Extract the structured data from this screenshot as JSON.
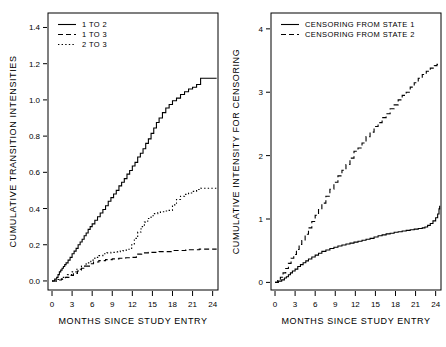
{
  "figure": {
    "width": 446,
    "height": 347,
    "background": "#ffffff",
    "ink_color": "#000000"
  },
  "chart_data": [
    {
      "id": "left",
      "type": "line",
      "title": "",
      "xlabel": "MONTHS SINCE STUDY ENTRY",
      "ylabel": "CUMULATIVE TRANSITION INTENSITIES",
      "xlim": [
        -0.6,
        24.8
      ],
      "ylim": [
        -0.05,
        1.48
      ],
      "xticks": [
        0,
        3,
        6,
        9,
        12,
        15,
        18,
        21,
        24
      ],
      "xtick_labels": [
        "0",
        "3",
        "6",
        "9",
        "12",
        "15",
        "18",
        "21",
        "24"
      ],
      "yticks": [
        0.0,
        0.2,
        0.4,
        0.6,
        0.8,
        1.0,
        1.2,
        1.4
      ],
      "ytick_labels": [
        "0.0",
        "0.2",
        "0.4",
        "0.6",
        "0.8",
        "1.0",
        "1.2",
        "1.4"
      ],
      "grid": false,
      "legend_position": "top-left",
      "step": true,
      "series": [
        {
          "name": "1 TO 2",
          "dash": "none",
          "x": [
            0,
            0.4,
            0.7,
            0.9,
            1.1,
            1.3,
            1.5,
            1.7,
            1.9,
            2.1,
            2.4,
            2.7,
            3.0,
            3.3,
            3.6,
            3.9,
            4.2,
            4.5,
            4.8,
            5.1,
            5.4,
            5.7,
            6.0,
            6.4,
            6.8,
            7.2,
            7.6,
            8.0,
            8.4,
            8.8,
            9.2,
            9.6,
            10.0,
            10.4,
            10.8,
            11.2,
            11.6,
            12.0,
            12.4,
            12.8,
            13.2,
            13.6,
            14.0,
            14.4,
            14.8,
            15.2,
            15.6,
            16.0,
            16.5,
            17.0,
            17.5,
            18.0,
            18.6,
            19.2,
            19.8,
            20.4,
            21.0,
            21.6,
            22.2,
            24.6
          ],
          "y": [
            0.0,
            0.01,
            0.02,
            0.035,
            0.05,
            0.06,
            0.07,
            0.08,
            0.09,
            0.1,
            0.115,
            0.13,
            0.15,
            0.165,
            0.18,
            0.2,
            0.215,
            0.23,
            0.25,
            0.265,
            0.285,
            0.3,
            0.315,
            0.335,
            0.355,
            0.375,
            0.395,
            0.415,
            0.44,
            0.46,
            0.48,
            0.5,
            0.525,
            0.545,
            0.565,
            0.59,
            0.61,
            0.635,
            0.655,
            0.685,
            0.705,
            0.73,
            0.76,
            0.785,
            0.815,
            0.845,
            0.875,
            0.9,
            0.93,
            0.955,
            0.975,
            0.995,
            1.01,
            1.03,
            1.045,
            1.06,
            1.07,
            1.085,
            1.12,
            1.12
          ]
        },
        {
          "name": "1 TO 3",
          "dash": "dashed",
          "x": [
            0,
            0.8,
            1.4,
            2.0,
            2.6,
            3.2,
            3.8,
            4.4,
            5.0,
            5.6,
            6.2,
            7.0,
            8.0,
            9.0,
            10.0,
            11.0,
            12.0,
            12.6,
            13.4,
            14.4,
            16.0,
            18.0,
            20.0,
            22.0,
            24.6
          ],
          "y": [
            0.0,
            0.005,
            0.012,
            0.02,
            0.03,
            0.042,
            0.055,
            0.07,
            0.082,
            0.095,
            0.105,
            0.112,
            0.118,
            0.122,
            0.125,
            0.128,
            0.13,
            0.148,
            0.155,
            0.158,
            0.162,
            0.168,
            0.172,
            0.176,
            0.176
          ]
        },
        {
          "name": "2 TO 3",
          "dash": "dotted",
          "x": [
            0,
            0.9,
            1.6,
            2.3,
            3.0,
            3.7,
            4.4,
            5.1,
            5.8,
            6.4,
            7.0,
            7.6,
            8.2,
            8.8,
            9.4,
            9.8,
            10.2,
            10.6,
            11.0,
            11.4,
            11.9,
            12.3,
            12.8,
            13.3,
            13.8,
            14.3,
            14.8,
            15.3,
            15.8,
            16.2,
            16.8,
            17.4,
            18.0,
            18.6,
            19.2,
            19.8,
            20.4,
            21.0,
            21.6,
            22.2,
            24.6
          ],
          "y": [
            0.0,
            0.008,
            0.02,
            0.035,
            0.05,
            0.065,
            0.082,
            0.1,
            0.115,
            0.13,
            0.14,
            0.15,
            0.155,
            0.158,
            0.16,
            0.162,
            0.165,
            0.168,
            0.17,
            0.175,
            0.2,
            0.235,
            0.27,
            0.3,
            0.325,
            0.345,
            0.36,
            0.372,
            0.378,
            0.382,
            0.386,
            0.39,
            0.42,
            0.45,
            0.468,
            0.478,
            0.486,
            0.495,
            0.505,
            0.512,
            0.512
          ]
        }
      ]
    },
    {
      "id": "right",
      "type": "line",
      "title": "",
      "xlabel": "MONTHS SINCE STUDY ENTRY",
      "ylabel": "CUMULATIVE INTENSITY FOR CENSORING",
      "xlim": [
        -0.6,
        24.8
      ],
      "ylim": [
        -0.12,
        4.25
      ],
      "xticks": [
        0,
        3,
        6,
        9,
        12,
        15,
        18,
        21,
        24
      ],
      "xtick_labels": [
        "0",
        "3",
        "6",
        "9",
        "12",
        "15",
        "18",
        "21",
        "24"
      ],
      "yticks": [
        0,
        1,
        2,
        3,
        4
      ],
      "ytick_labels": [
        "0",
        "1",
        "2",
        "3",
        "4"
      ],
      "grid": false,
      "legend_position": "top-left",
      "step": true,
      "series": [
        {
          "name": "CENSORING FROM STATE 1",
          "dash": "none",
          "x": [
            0,
            0.5,
            1.0,
            1.4,
            1.7,
            2.0,
            2.3,
            2.6,
            3.0,
            3.4,
            3.8,
            4.2,
            4.6,
            5.0,
            5.5,
            6.0,
            6.5,
            7.0,
            7.6,
            8.2,
            8.8,
            9.4,
            10.0,
            10.6,
            11.2,
            11.8,
            12.4,
            13.0,
            13.6,
            14.2,
            14.8,
            15.4,
            16.0,
            16.6,
            17.2,
            17.8,
            18.4,
            19.0,
            19.6,
            20.2,
            20.8,
            21.4,
            22.0,
            22.4,
            22.8,
            23.2,
            23.6,
            24.0,
            24.3,
            24.5,
            24.6
          ],
          "y": [
            0.0,
            0.02,
            0.04,
            0.07,
            0.09,
            0.12,
            0.15,
            0.18,
            0.21,
            0.25,
            0.28,
            0.31,
            0.34,
            0.37,
            0.4,
            0.43,
            0.46,
            0.49,
            0.51,
            0.535,
            0.555,
            0.575,
            0.59,
            0.605,
            0.62,
            0.635,
            0.65,
            0.665,
            0.68,
            0.695,
            0.715,
            0.735,
            0.75,
            0.765,
            0.775,
            0.79,
            0.8,
            0.81,
            0.82,
            0.83,
            0.84,
            0.85,
            0.86,
            0.875,
            0.9,
            0.93,
            0.97,
            1.02,
            1.08,
            1.16,
            1.21
          ]
        },
        {
          "name": "CENSORING FROM STATE 2",
          "dash": "dashed",
          "x": [
            0,
            0.4,
            0.8,
            1.2,
            1.6,
            2.0,
            2.4,
            2.8,
            3.2,
            3.6,
            4.0,
            4.5,
            5.0,
            5.5,
            6.0,
            6.5,
            7.0,
            7.6,
            8.2,
            8.8,
            9.4,
            10.0,
            10.6,
            11.2,
            11.8,
            12.4,
            13.0,
            13.6,
            14.2,
            14.8,
            15.4,
            16.0,
            16.6,
            17.2,
            17.8,
            18.4,
            19.0,
            19.6,
            20.2,
            20.8,
            21.4,
            22.0,
            22.6,
            23.2,
            23.8,
            24.2,
            24.5
          ],
          "y": [
            0.0,
            0.03,
            0.08,
            0.15,
            0.22,
            0.3,
            0.38,
            0.44,
            0.52,
            0.6,
            0.66,
            0.76,
            0.86,
            0.96,
            1.06,
            1.15,
            1.25,
            1.36,
            1.47,
            1.58,
            1.68,
            1.77,
            1.86,
            1.96,
            2.07,
            2.12,
            2.2,
            2.3,
            2.37,
            2.46,
            2.52,
            2.6,
            2.66,
            2.74,
            2.8,
            2.88,
            2.95,
            3.0,
            3.08,
            3.15,
            3.22,
            3.28,
            3.33,
            3.38,
            3.42,
            3.44,
            3.45
          ]
        }
      ]
    }
  ]
}
